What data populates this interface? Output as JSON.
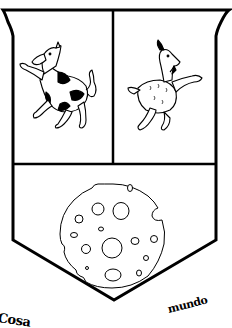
{
  "emblem": {
    "type": "coat-of-arms",
    "colors": {
      "ink": "#000000",
      "field": "#ffffff"
    },
    "quadrants": [
      {
        "position": "top-left",
        "charge": "cow-rampant",
        "description": "black and white spotted cow, rampant, facing left"
      },
      {
        "position": "top-right",
        "charge": "goat-rampant",
        "description": "white goat, rampant, facing right"
      },
      {
        "position": "bottom",
        "charge": "cheese-wheel",
        "description": "round Swiss cheese with holes"
      }
    ],
    "motto": {
      "left_fragment": "Cosa",
      "right_fragment": "mundo"
    }
  }
}
